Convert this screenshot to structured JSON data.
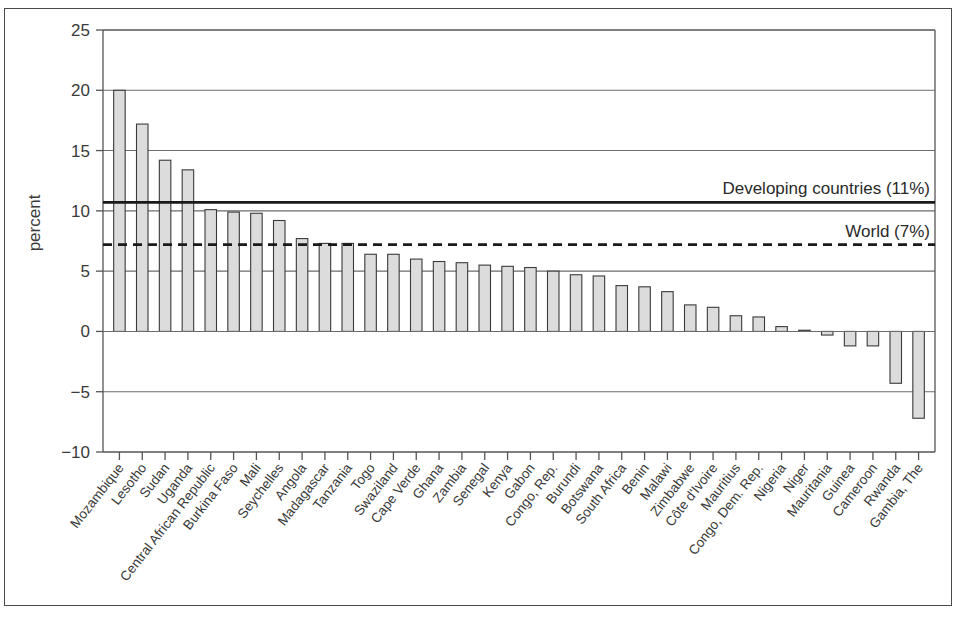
{
  "chart_data": {
    "type": "bar",
    "title": "",
    "subtitle": "",
    "xlabel": "",
    "ylabel": "percent",
    "ylim": [
      -10,
      25
    ],
    "yticks": [
      25,
      20,
      15,
      10,
      5,
      0,
      -5,
      -10
    ],
    "ytick_labels": [
      "25",
      "20",
      "15",
      "10",
      "5",
      "0",
      "−5",
      "−10"
    ],
    "grid": true,
    "grid_axis": "y",
    "legend": "none",
    "bar_fill": "#dcdcdc",
    "bar_edge": "#3a3a3a",
    "categories": [
      "Mozambique",
      "Lesotho",
      "Sudan",
      "Uganda",
      "Central African Republic",
      "Burkina Faso",
      "Mali",
      "Seychelles",
      "Angola",
      "Madagascar",
      "Tanzania",
      "Togo",
      "Swaziland",
      "Cape Verde",
      "Ghana",
      "Zambia",
      "Senegal",
      "Kenya",
      "Gabon",
      "Congo, Rep.",
      "Burundi",
      "Botswana",
      "South Africa",
      "Benin",
      "Malawi",
      "Zimbabwe",
      "Côte d'Ivoire",
      "Mauritius",
      "Congo, Dem. Rep.",
      "Nigeria",
      "Niger",
      "Mauritania",
      "Guinea",
      "Cameroon",
      "Rwanda",
      "Gambia, The"
    ],
    "values": [
      20.0,
      17.2,
      14.2,
      13.4,
      10.1,
      9.9,
      9.8,
      9.2,
      7.7,
      7.3,
      7.3,
      6.4,
      6.4,
      6.0,
      5.8,
      5.7,
      5.5,
      5.4,
      5.3,
      5.0,
      4.7,
      4.6,
      3.8,
      3.7,
      3.3,
      2.2,
      2.0,
      1.3,
      1.2,
      0.4,
      0.1,
      -0.3,
      -1.2,
      -1.2,
      -4.3,
      -7.2
    ],
    "reference_lines": [
      {
        "name": "developing-countries",
        "label": "Developing countries (11%)",
        "value": 10.7,
        "style": "solid"
      },
      {
        "name": "world",
        "label": "World (7%)",
        "value": 7.2,
        "style": "dashed"
      }
    ]
  }
}
